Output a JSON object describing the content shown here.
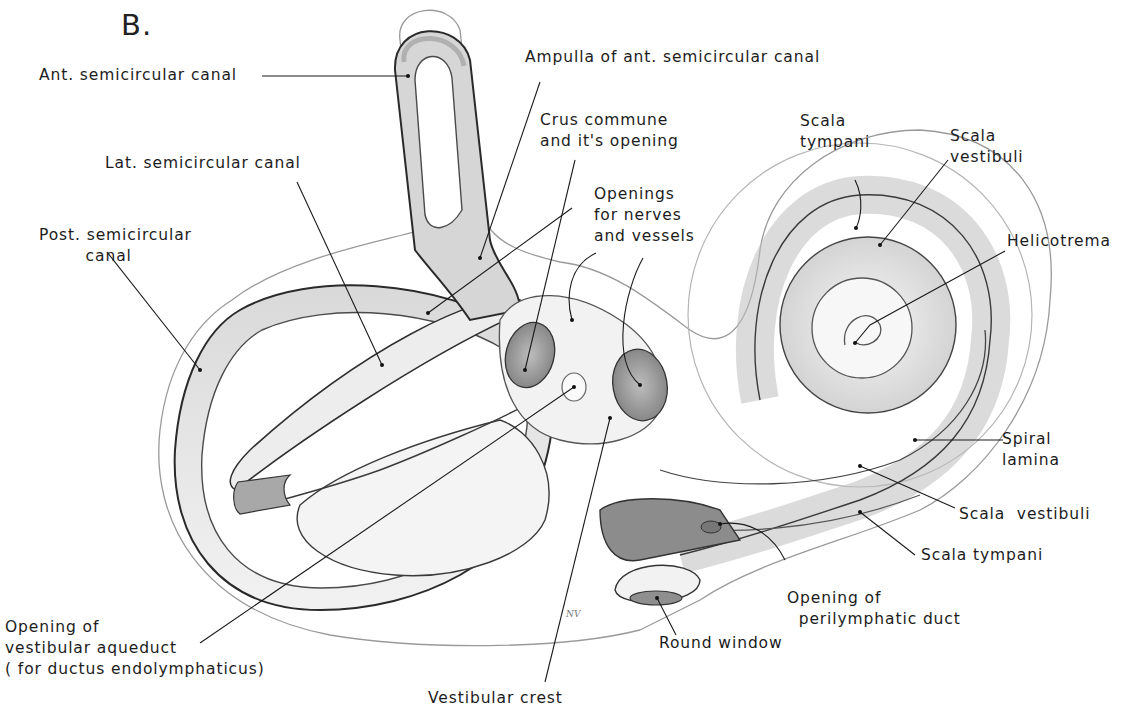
{
  "figure": {
    "letter": "B.",
    "artist_signature": "NV"
  },
  "labels": {
    "ant_semicircular_canal": "Ant. semicircular canal",
    "ampulla_ant_semicircular_canal": "Ampulla of ant. semicircular canal",
    "lat_semicircular_canal": "Lat. semicircular canal",
    "crus_commune": "Crus commune\nand it's opening",
    "openings_nerves_vessels": "Openings\nfor nerves\nand vessels",
    "post_semicircular_canal": "Post. semicircular\n        canal",
    "scala_tympani_top": "Scala\ntympani",
    "scala_vestibuli_top": "Scala\nvestibuli",
    "helicotrema": "Helicotrema",
    "spiral_lamina": "Spiral\nlamina",
    "scala_vestibuli_bottom": "Scala  vestibuli",
    "scala_tympani_bottom": "Scala tympani",
    "opening_perilymphatic_duct": "Opening of\n  perilymphatic duct",
    "round_window": "Round window",
    "opening_vestibular_aqueduct": "Opening of\nvestibular aqueduct\n( for ductus endolymphaticus)",
    "vestibular_crest": "Vestibular crest"
  },
  "colors": {
    "background": "#ffffff",
    "ink": "#1c1c1c",
    "shade_dark": "#8a8a8a",
    "shade_mid": "#bdbdbd",
    "shade_light": "#e4e4e4"
  }
}
